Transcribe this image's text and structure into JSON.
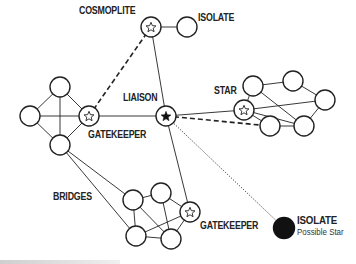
{
  "diagram": {
    "labels": {
      "cosmoplite": "COSMOPLITE",
      "isolate_top": "ISOLATE",
      "liaison": "LIAISON",
      "star": "STAR",
      "gatekeeper_left": "GATEKEEPER",
      "bridges": "BRIDGES",
      "gatekeeper_bottom": "GATEKEEPER",
      "isolate_bottom": "ISOLATE",
      "isolate_bottom_sub": "Possible Star"
    },
    "colors": {
      "stroke": "#222222",
      "fill": "#ffffff",
      "filled_node": "#111111"
    },
    "nodes": [
      {
        "id": "left-top",
        "x": 60,
        "y": 87,
        "type": "plain"
      },
      {
        "id": "left-left",
        "x": 30,
        "y": 116,
        "type": "plain"
      },
      {
        "id": "gatekeeper-left",
        "x": 89,
        "y": 116,
        "type": "star-outline"
      },
      {
        "id": "left-bottom",
        "x": 60,
        "y": 145,
        "type": "plain"
      },
      {
        "id": "cosmoplite",
        "x": 151,
        "y": 27,
        "type": "star-outline"
      },
      {
        "id": "isolate-top",
        "x": 187,
        "y": 27,
        "type": "plain"
      },
      {
        "id": "liaison",
        "x": 166,
        "y": 116,
        "type": "star-filled"
      },
      {
        "id": "star",
        "x": 244,
        "y": 110,
        "type": "star-outline"
      },
      {
        "id": "star-n1",
        "x": 253,
        "y": 86,
        "type": "plain"
      },
      {
        "id": "star-n2",
        "x": 293,
        "y": 81,
        "type": "plain"
      },
      {
        "id": "star-n3",
        "x": 325,
        "y": 100,
        "type": "plain"
      },
      {
        "id": "star-n4",
        "x": 270,
        "y": 126,
        "type": "plain"
      },
      {
        "id": "star-n5",
        "x": 304,
        "y": 126,
        "type": "plain"
      },
      {
        "id": "bottom-b1",
        "x": 133,
        "y": 200,
        "type": "plain"
      },
      {
        "id": "bottom-b2",
        "x": 161,
        "y": 193,
        "type": "plain"
      },
      {
        "id": "gatekeeper-bottom",
        "x": 190,
        "y": 212,
        "type": "star-outline"
      },
      {
        "id": "bottom-b3",
        "x": 136,
        "y": 236,
        "type": "plain"
      },
      {
        "id": "bottom-b4",
        "x": 171,
        "y": 239,
        "type": "plain"
      },
      {
        "id": "isolate-bottom",
        "x": 284,
        "y": 228,
        "type": "filled"
      }
    ],
    "edges": [
      {
        "from": "left-top",
        "to": "left-left",
        "style": "solid"
      },
      {
        "from": "left-top",
        "to": "gatekeeper-left",
        "style": "solid"
      },
      {
        "from": "left-top",
        "to": "left-bottom",
        "style": "solid"
      },
      {
        "from": "left-left",
        "to": "gatekeeper-left",
        "style": "solid"
      },
      {
        "from": "left-left",
        "to": "left-bottom",
        "style": "solid"
      },
      {
        "from": "gatekeeper-left",
        "to": "left-bottom",
        "style": "solid"
      },
      {
        "from": "gatekeeper-left",
        "to": "cosmoplite",
        "style": "dashed"
      },
      {
        "from": "gatekeeper-left",
        "to": "liaison",
        "style": "solid"
      },
      {
        "from": "cosmoplite",
        "to": "isolate-top",
        "style": "solid"
      },
      {
        "from": "cosmoplite",
        "to": "liaison",
        "style": "solid"
      },
      {
        "from": "liaison",
        "to": "star",
        "style": "solid"
      },
      {
        "from": "liaison",
        "to": "star-n4",
        "style": "dashed"
      },
      {
        "from": "liaison",
        "to": "gatekeeper-bottom",
        "style": "solid"
      },
      {
        "from": "liaison",
        "to": "isolate-bottom",
        "style": "dotted"
      },
      {
        "from": "star",
        "to": "star-n1",
        "style": "solid"
      },
      {
        "from": "star",
        "to": "star-n3",
        "style": "solid"
      },
      {
        "from": "star",
        "to": "star-n4",
        "style": "solid"
      },
      {
        "from": "star",
        "to": "star-n5",
        "style": "solid"
      },
      {
        "from": "star-n1",
        "to": "star-n2",
        "style": "solid"
      },
      {
        "from": "star-n1",
        "to": "star-n5",
        "style": "solid"
      },
      {
        "from": "star-n2",
        "to": "star-n3",
        "style": "solid"
      },
      {
        "from": "star-n3",
        "to": "star-n5",
        "style": "solid"
      },
      {
        "from": "star-n4",
        "to": "star-n5",
        "style": "solid"
      },
      {
        "from": "left-bottom",
        "to": "bottom-b1",
        "style": "solid"
      },
      {
        "from": "left-bottom",
        "to": "bottom-b3",
        "style": "solid"
      },
      {
        "from": "bottom-b1",
        "to": "bottom-b2",
        "style": "solid"
      },
      {
        "from": "bottom-b1",
        "to": "bottom-b3",
        "style": "solid"
      },
      {
        "from": "bottom-b1",
        "to": "bottom-b4",
        "style": "solid"
      },
      {
        "from": "bottom-b2",
        "to": "gatekeeper-bottom",
        "style": "solid"
      },
      {
        "from": "bottom-b2",
        "to": "bottom-b4",
        "style": "solid"
      },
      {
        "from": "bottom-b3",
        "to": "gatekeeper-bottom",
        "style": "solid"
      },
      {
        "from": "bottom-b3",
        "to": "bottom-b4",
        "style": "solid"
      },
      {
        "from": "gatekeeper-bottom",
        "to": "bottom-b4",
        "style": "solid"
      }
    ]
  }
}
